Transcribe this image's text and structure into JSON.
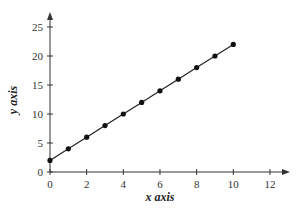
{
  "chart_data": {
    "type": "line",
    "title": "",
    "xlabel": "x axis",
    "ylabel": "y axis",
    "x": [
      0,
      1,
      2,
      3,
      4,
      5,
      6,
      7,
      8,
      9,
      10
    ],
    "series": [
      {
        "name": "y = 2x + 2",
        "values": [
          2,
          4,
          6,
          8,
          10,
          12,
          14,
          16,
          18,
          20,
          22
        ]
      }
    ],
    "xlim": [
      0,
      13
    ],
    "ylim": [
      0,
      27
    ],
    "xticks": [
      0,
      2,
      4,
      6,
      8,
      10,
      12
    ],
    "yticks": [
      0,
      5,
      10,
      15,
      20,
      25
    ],
    "grid": false,
    "legend": "none",
    "markers": "filled-circle",
    "line_color": "#222222",
    "axis_color": "#333333"
  }
}
